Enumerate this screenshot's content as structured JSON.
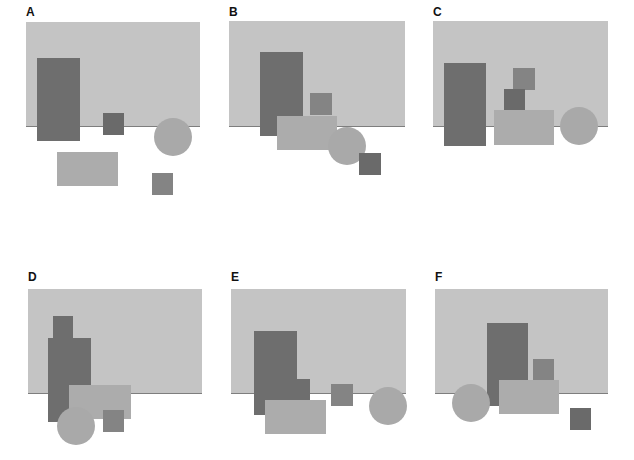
{
  "panels": [
    {
      "label": "A"
    },
    {
      "label": "B"
    },
    {
      "label": "C"
    },
    {
      "label": "D"
    },
    {
      "label": "E"
    },
    {
      "label": "F"
    }
  ],
  "colors": {
    "background_rect": "#c4c4c4",
    "horizon_line": "#7e7e7e",
    "tall_dark_rect": "#6e6e6e",
    "small_square": "#848484",
    "wide_light_rect": "#acacac",
    "circle": "#a9a9a9"
  }
}
